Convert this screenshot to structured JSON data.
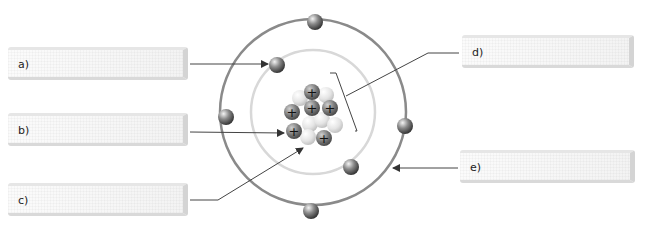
{
  "diagram": {
    "labels": [
      {
        "id": "a",
        "text": "a)",
        "points_to": "electron"
      },
      {
        "id": "b",
        "text": "b)",
        "points_to": "proton"
      },
      {
        "id": "c",
        "text": "c)",
        "points_to": "neutron"
      },
      {
        "id": "d",
        "text": "d)",
        "points_to": "nucleus"
      },
      {
        "id": "e",
        "text": "e)",
        "points_to": "electron shell / orbit"
      }
    ],
    "nucleus": {
      "protons": 6,
      "neutrons": 6,
      "proton_symbol": "+"
    },
    "shells": [
      {
        "name": "inner",
        "electrons": 2
      },
      {
        "name": "outer",
        "electrons": 4
      }
    ],
    "electron_symbol": "−",
    "colors": {
      "outer_orbit": "#8a8a8a",
      "inner_orbit": "#d8d8d8",
      "proton": "#7a7a7a",
      "neutron": "#e6e6e6",
      "line": "#555555"
    }
  }
}
